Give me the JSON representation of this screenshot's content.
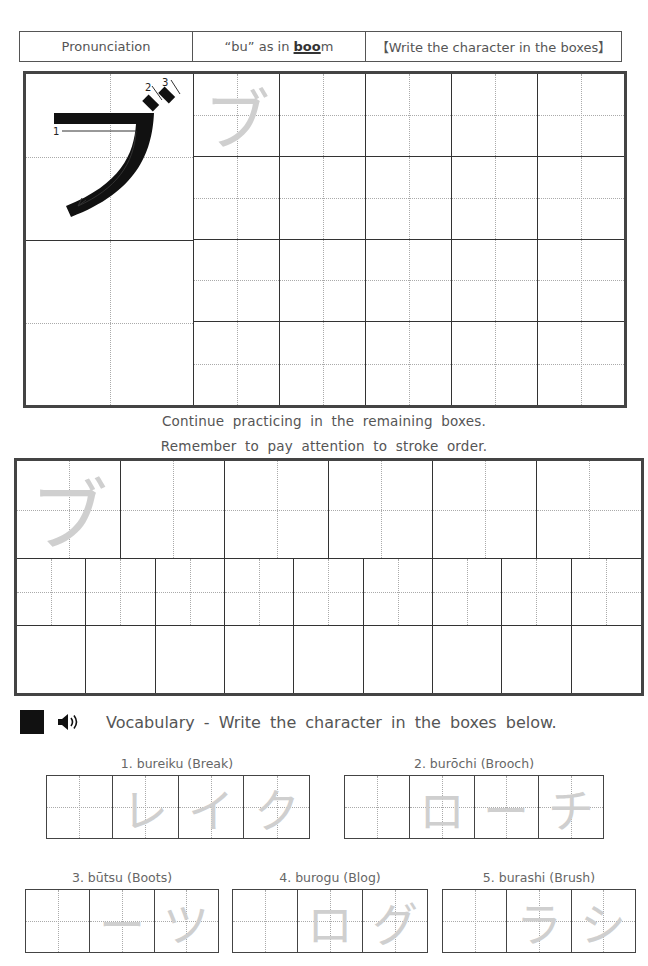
{
  "header": {
    "pronunciation_label": "Pronunciation",
    "sound_prefix": "“bu” as in ",
    "sound_highlight": "boo",
    "sound_suffix": "m",
    "instruction": "【Write the character in the boxes】"
  },
  "model_character": {
    "glyph": "ブ",
    "stroke_numbers": [
      "1",
      "2",
      "3"
    ]
  },
  "practice_grid": {
    "trace_glyph": "ブ",
    "rows": 4,
    "cols": 5
  },
  "instructions": {
    "line1": "Continue practicing in the remaining boxes.",
    "line2": "Remember to pay attention to stroke order."
  },
  "extra_grid": {
    "trace_glyph": "ブ",
    "row1_cols": 6,
    "row2_cols": 9,
    "row3_cols": 9
  },
  "vocabulary": {
    "heading": "Vocabulary - Write the character in the boxes below.",
    "icons": [
      "square-marker-icon",
      "speaker-icon"
    ],
    "words": [
      {
        "label": "1. bureiku (Break)",
        "trace": [
          "",
          "レ",
          "イ",
          "ク"
        ]
      },
      {
        "label": "2. burōchi (Brooch)",
        "trace": [
          "",
          "ロ",
          "ー",
          "チ"
        ]
      },
      {
        "label": "3. būtsu (Boots)",
        "trace": [
          "",
          "ー",
          "ツ"
        ]
      },
      {
        "label": "4. burogu (Blog)",
        "trace": [
          "",
          "ロ",
          "グ"
        ]
      },
      {
        "label": "5. burashi (Brush)",
        "trace": [
          "",
          "ラ",
          "シ"
        ]
      }
    ]
  },
  "colors": {
    "border": "#444444",
    "guide": "#aaaaaa",
    "trace": "#cfcfcf",
    "text": "#555555"
  }
}
